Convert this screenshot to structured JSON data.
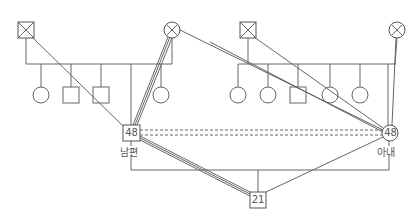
{
  "diagram": {
    "type": "genogram",
    "line_color": "#666666",
    "husband": {
      "age": "48",
      "label": "남편",
      "shape": "square"
    },
    "wife": {
      "age": "48",
      "label": "아내",
      "shape": "circle"
    },
    "child": {
      "age": "21",
      "shape": "square"
    },
    "husband_family": {
      "father": {
        "shape": "square",
        "deceased": true
      },
      "mother": {
        "shape": "circle",
        "deceased": true
      },
      "siblings": [
        "circle",
        "square",
        "square",
        "self-husband",
        "circle"
      ]
    },
    "wife_family": {
      "father": {
        "shape": "square",
        "deceased": true
      },
      "mother": {
        "shape": "circle",
        "deceased": true
      },
      "siblings": [
        "circle",
        "circle",
        "square",
        "circle",
        "circle",
        "self-wife"
      ]
    },
    "relationships": [
      {
        "from": "husband",
        "to": "wife",
        "type": "distant (dashed)"
      },
      {
        "from": "husband",
        "to": "husband-mother",
        "type": "close (triple line)"
      },
      {
        "from": "husband",
        "to": "child",
        "type": "close (triple line)"
      },
      {
        "from": "husband-father",
        "to": "husband",
        "type": "single line"
      },
      {
        "from": "husband-mother",
        "to": "wife",
        "type": "single line"
      },
      {
        "from": "wife-father",
        "to": "wife",
        "type": "single line"
      },
      {
        "from": "wife-mother",
        "to": "wife",
        "type": "single line"
      },
      {
        "from": "wife",
        "to": "child",
        "type": "single line"
      }
    ]
  }
}
